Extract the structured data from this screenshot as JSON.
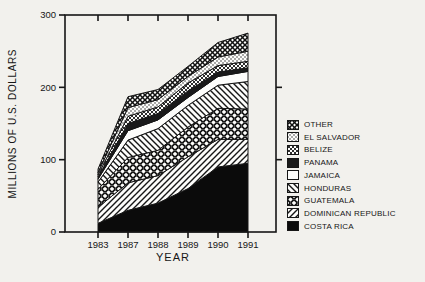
{
  "chart_data": {
    "type": "area",
    "stacked": true,
    "xlabel": "YEAR",
    "ylabel": "MILLIONS OF U.S. DOLLARS",
    "categories": [
      "1983",
      "1987",
      "1988",
      "1989",
      "1990",
      "1991"
    ],
    "yticks": [
      0,
      100,
      200,
      300
    ],
    "ylim": [
      0,
      300
    ],
    "grid": false,
    "legend_position": "right",
    "series": [
      {
        "name": "OTHER",
        "pattern": "crosshatch-dense",
        "values": [
          5,
          15,
          14,
          14,
          20,
          25
        ]
      },
      {
        "name": "EL SALVADOR",
        "pattern": "stipple",
        "values": [
          3,
          12,
          10,
          9,
          12,
          14
        ]
      },
      {
        "name": "BELIZE",
        "pattern": "weave",
        "values": [
          3,
          10,
          9,
          11,
          9,
          9
        ]
      },
      {
        "name": "PANAMA",
        "pattern": "solid-dark",
        "values": [
          3,
          10,
          9,
          9,
          6,
          5
        ]
      },
      {
        "name": "JAMAICA",
        "pattern": "white",
        "values": [
          4,
          13,
          12,
          11,
          12,
          14
        ]
      },
      {
        "name": "HONDURAS",
        "pattern": "diagonal-back",
        "values": [
          10,
          24,
          30,
          30,
          32,
          38
        ]
      },
      {
        "name": "GUATEMALA",
        "pattern": "chainlink",
        "values": [
          25,
          35,
          35,
          41,
          43,
          42
        ]
      },
      {
        "name": "DOMINICAN REPUBLIC",
        "pattern": "diagonal-forward",
        "values": [
          22,
          38,
          38,
          44,
          38,
          33
        ]
      },
      {
        "name": "COSTA RICA",
        "pattern": "solid-black",
        "values": [
          12,
          30,
          40,
          60,
          90,
          95
        ]
      }
    ],
    "colors": {
      "ink": "#161616",
      "paper": "#f2f1ed",
      "area_bg": "#fdfdfb"
    }
  }
}
